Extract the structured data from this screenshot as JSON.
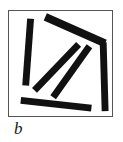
{
  "figure": {
    "panel_label": "b",
    "frame": {
      "border_color": "#555555",
      "background_color": "#ffffff",
      "x": 8,
      "y": 10,
      "width": 105,
      "height": 107
    },
    "bar_color": "#111111",
    "bar_count": 6
  },
  "chart_data": {
    "type": "scatter",
    "title": "",
    "subtitle": "",
    "xlabel": "",
    "ylabel": "",
    "annotations": [
      "b"
    ],
    "legend": [],
    "grid": false,
    "xlim": [
      0,
      105
    ],
    "ylim": [
      0,
      107
    ],
    "series": [
      {
        "name": "bars",
        "points": [
          {
            "id": "bar-left-vertical",
            "x1": 22,
            "y1": 8,
            "x2": 17,
            "y2": 76,
            "width": 7,
            "angle_deg": 94,
            "length": 68
          },
          {
            "id": "bar-top-diagonal",
            "x1": 37,
            "y1": 6,
            "x2": 98,
            "y2": 33,
            "width": 8,
            "angle_deg": 24,
            "length": 67
          },
          {
            "id": "bar-right-vertical",
            "x1": 96,
            "y1": 32,
            "x2": 98,
            "y2": 102,
            "width": 7,
            "angle_deg": 88,
            "length": 70
          },
          {
            "id": "bar-mid-diagonal-upper",
            "x1": 26,
            "y1": 81,
            "x2": 71,
            "y2": 34,
            "width": 7,
            "angle_deg": -46,
            "length": 65
          },
          {
            "id": "bar-mid-diagonal-lower",
            "x1": 45,
            "y1": 88,
            "x2": 82,
            "y2": 36,
            "width": 7,
            "angle_deg": -55,
            "length": 64
          },
          {
            "id": "bar-bottom-horizontal",
            "x1": 12,
            "y1": 91,
            "x2": 84,
            "y2": 99,
            "width": 7,
            "angle_deg": 6,
            "length": 72
          }
        ]
      }
    ]
  }
}
